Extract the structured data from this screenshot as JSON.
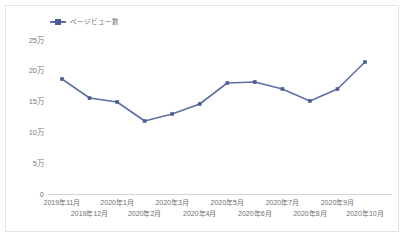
{
  "chart_data": {
    "type": "line",
    "title": "",
    "subtitle": "",
    "xlabel": "",
    "ylabel": "",
    "series": [
      {
        "name": "ページビュー数",
        "values": [
          186700,
          155800,
          149400,
          118500,
          129900,
          146100,
          180200,
          181800,
          170500,
          151000,
          170500,
          214300
        ]
      }
    ],
    "categories": [
      "2019年11月",
      "2019年12月",
      "2020年1月",
      "2020年2月",
      "2020年3月",
      "2020年4月",
      "2020年5月",
      "2020年6月",
      "2020年7月",
      "2020年8月",
      "2020年9月",
      "2020年10月"
    ],
    "ytick_labels": [
      "25万",
      "20万",
      "15万",
      "10万",
      "5万",
      "0"
    ],
    "ytick_values": [
      250000,
      200000,
      150000,
      100000,
      50000,
      0
    ],
    "ylim": [
      0,
      250000
    ],
    "grid": false,
    "legend_position": "top-left",
    "colors": {
      "line": "#5e6fa8",
      "marker": "#4a5b96",
      "axis": "#d0d0d0",
      "tick_text": "#7a7a7a",
      "frame_border": "#e3e3e3",
      "background": "#ffffff"
    }
  },
  "legend": {
    "entries": [
      {
        "label": "ページビュー数"
      }
    ]
  }
}
